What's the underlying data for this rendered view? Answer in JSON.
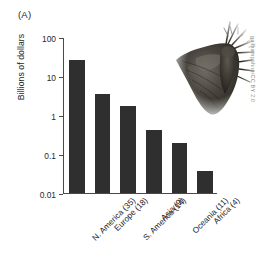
{
  "figure": {
    "panel_label": "(A)",
    "credit": "gailhampshire/CC BY 2.0",
    "moth_icon": "moth-photograph",
    "background_color": "#ffffff",
    "bar_color": "#2f2f2f",
    "axis_color": "#4a4a4a"
  },
  "chart_data": {
    "type": "bar",
    "title": "",
    "xlabel": "",
    "ylabel": "Billions of dollars",
    "yscale": "log",
    "ylim": [
      0.01,
      100
    ],
    "ytick_labels": [
      "100",
      "10",
      "1",
      "0.1",
      "0.01"
    ],
    "ytick_values": [
      100,
      10,
      1,
      0.1,
      0.01
    ],
    "grid": false,
    "legend": "none",
    "categories": [
      "N. America (35)",
      "Europe (18)",
      "S. America (14)",
      "Asia (9)",
      "Oceania (11)",
      "Africa (4)"
    ],
    "values": [
      27,
      3.6,
      1.8,
      0.42,
      0.2,
      0.038
    ],
    "region_names": [
      "N. America",
      "Europe",
      "S. America",
      "Asia",
      "Oceania",
      "Africa"
    ],
    "species_counts": [
      35,
      18,
      14,
      9,
      11,
      4
    ]
  }
}
